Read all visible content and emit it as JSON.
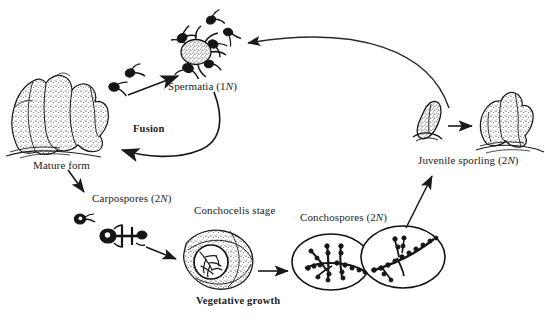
{
  "figure": {
    "type": "life-cycle-diagram",
    "organism": "Porphyra (nori) seaweed",
    "background_color": "#ffffff",
    "ink_color": "#1a1a1a"
  },
  "labels": {
    "spermatia": "Spermatia (1N)",
    "fusion": "Fusion",
    "mature_form": "Mature form",
    "carpospores": "Carpospores (2N)",
    "conchocelis_stage": "Conchocelis stage",
    "vegetative_growth": "Vegetative growth",
    "conchospores": "Conchospores (2N)",
    "juvenile_sporling": "Juvenile sporling (2N)"
  },
  "ploidy": {
    "spermatia": "1N",
    "carpospores": "2N",
    "conchospores": "2N",
    "juvenile_sporling": "2N"
  },
  "stages": [
    {
      "id": "spermatia",
      "label": "Spermatia (1N)",
      "ploidy": "1N",
      "illustration": "cluster-of-spermatia-cells"
    },
    {
      "id": "mature-form",
      "label": "Mature form",
      "ploidy": "",
      "illustration": "lobed-stippled-thallus"
    },
    {
      "id": "carpospores",
      "label": "Carpospores (2N)",
      "ploidy": "2N",
      "illustration": "carpospore-cells"
    },
    {
      "id": "conchocelis-stage",
      "label": "Conchocelis stage",
      "ploidy": "",
      "illustration": "shell-with-magnified-filaments"
    },
    {
      "id": "conchospores",
      "label": "Conchospores (2N)",
      "ploidy": "2N",
      "illustration": "oval-with-beaded-filaments"
    },
    {
      "id": "juvenile-sporling",
      "label": "Juvenile sporling (2N)",
      "ploidy": "2N",
      "illustration": "small-blade-and-young-thallus"
    }
  ],
  "transitions": [
    {
      "id": "spermatia-to-mature",
      "label": "Fusion",
      "from": "spermatia",
      "to": "mature-form",
      "style": "curved-arrow"
    },
    {
      "id": "release-to-spermatia",
      "label": "",
      "from": "spermatia-cells",
      "to": "spermatia",
      "style": "straight-arrow"
    },
    {
      "id": "mature-to-carpospores",
      "label": "",
      "from": "mature-form",
      "to": "carpospores",
      "style": "straight-arrow"
    },
    {
      "id": "carpospores-to-conchocelis",
      "label": "",
      "from": "carpospores",
      "to": "conchocelis-stage",
      "style": "straight-arrow"
    },
    {
      "id": "conchocelis-to-conchospores",
      "label": "Vegetative growth",
      "from": "conchocelis-stage",
      "to": "conchospores",
      "style": "straight-arrow"
    },
    {
      "id": "conchospores-to-juvenile",
      "label": "",
      "from": "conchospores",
      "to": "juvenile-sporling",
      "style": "straight-arrow"
    },
    {
      "id": "juvenile-to-mature-thallus",
      "label": "",
      "from": "juvenile-sporling",
      "to": "young-thallus",
      "style": "straight-arrow"
    },
    {
      "id": "juvenile-to-spermatia",
      "label": "",
      "from": "juvenile-sporling",
      "to": "spermatia",
      "style": "long-arc-arrow"
    }
  ]
}
